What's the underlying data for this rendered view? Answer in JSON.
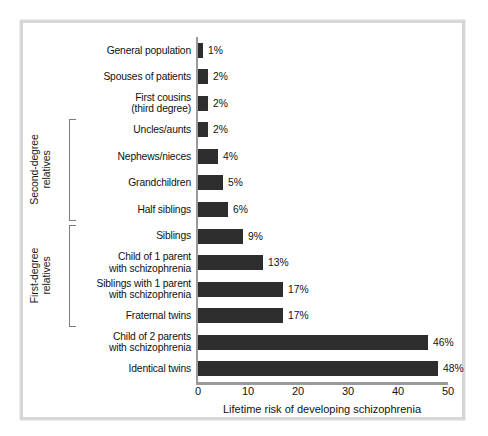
{
  "figure": {
    "frame_color": "#d6d6d6",
    "background": "#ffffff",
    "bar_color": "#2d2d2d",
    "axis_color": "#9a9a9a"
  },
  "axis": {
    "xlabel": "Lifetime risk of developing schizophrenia",
    "ticks": [
      "0",
      "10",
      "20",
      "30",
      "40",
      "50"
    ],
    "tick_values": [
      0,
      10,
      20,
      30,
      40,
      50
    ],
    "xmin": 0,
    "xmax": 50
  },
  "groups": [
    {
      "label": "Second-degree\nrelatives",
      "start_index": 3,
      "end_index": 6
    },
    {
      "label": "First-degree\nrelatives",
      "start_index": 7,
      "end_index": 10
    }
  ],
  "chart_data": {
    "type": "bar",
    "orientation": "horizontal",
    "title": "",
    "subtitle": "",
    "xlabel": "Lifetime risk of developing schizophrenia",
    "ylabel": "",
    "xlim": [
      0,
      50
    ],
    "grid": false,
    "legend": false,
    "value_suffix": "%",
    "categories": [
      "General population",
      "Spouses of patients",
      "First cousins\n(third degree)",
      "Uncles/aunts",
      "Nephews/nieces",
      "Grandchildren",
      "Half siblings",
      "Siblings",
      "Child of 1 parent\nwith schizophrenia",
      "Siblings with 1 parent\nwith schizophrenia",
      "Fraternal twins",
      "Child of 2 parents\nwith schizophrenia",
      "Identical twins"
    ],
    "values": [
      1,
      2,
      2,
      2,
      4,
      5,
      6,
      9,
      13,
      17,
      17,
      46,
      48
    ],
    "labels": [
      "1%",
      "2%",
      "2%",
      "2%",
      "4%",
      "5%",
      "6%",
      "9%",
      "13%",
      "17%",
      "17%",
      "46%",
      "48%"
    ]
  }
}
